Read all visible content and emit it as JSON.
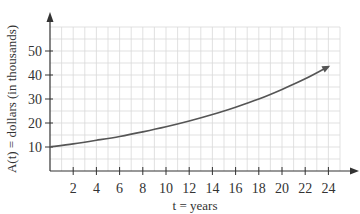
{
  "chart_data": {
    "type": "line",
    "title": "",
    "xlabel": "t = years",
    "ylabel": "A(t) = dollars (in thousands)",
    "xlim": [
      0,
      25
    ],
    "ylim": [
      0,
      60
    ],
    "x_ticks": [
      2,
      4,
      6,
      8,
      10,
      12,
      14,
      16,
      18,
      20,
      22,
      24
    ],
    "y_ticks": [
      10,
      20,
      30,
      40,
      50
    ],
    "grid": true,
    "grid_minor_x": 1,
    "grid_minor_y": 5,
    "legend": null,
    "series": [
      {
        "name": "A(t)",
        "x": [
          0,
          2,
          4,
          6,
          8,
          10,
          12,
          14,
          16,
          18,
          20,
          22,
          24
        ],
        "values": [
          10,
          11.3,
          12.8,
          14.4,
          16.3,
          18.4,
          20.8,
          23.5,
          26.6,
          30.0,
          34.0,
          38.4,
          43.5
        ],
        "end_arrow": true
      }
    ]
  },
  "colors": {
    "grid": "#d9d9d9",
    "axis": "#333333",
    "curve": "#555555"
  }
}
